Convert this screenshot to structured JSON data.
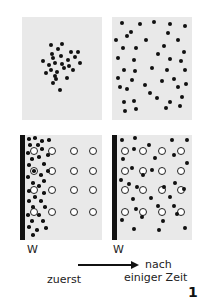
{
  "panels": {
    "top_left": {
      "description": "clustered particles (initial concentration)",
      "box": [
        22,
        17,
        80,
        103
      ]
    },
    "top_right": {
      "description": "particles evenly spread",
      "box": [
        112,
        17,
        80,
        103
      ]
    },
    "bottom_left": {
      "description": "particles concentrated at wall W, open circles in grid",
      "box": [
        20,
        135,
        82,
        105
      ]
    },
    "bottom_right": {
      "description": "particles dispersed among open circles, wall W",
      "box": [
        112,
        135,
        80,
        105
      ]
    }
  },
  "labels": {
    "wall_left": "W",
    "wall_right": "W",
    "before": "zuerst",
    "after_line1": "nach",
    "after_line2": "einiger Zeit",
    "figure_number": "1"
  },
  "colors": {
    "panel_bg": "#e9e9e9",
    "dot": "#111111",
    "ring_fill": "#ffffff"
  }
}
